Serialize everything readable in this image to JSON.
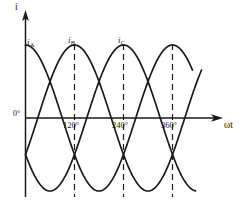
{
  "figure": {
    "axis_y_label": "i",
    "axis_x_label": "ωt",
    "origin_label": "0°",
    "line_color": "#1a1a1a",
    "background_color": "#ffffff"
  },
  "curves": [
    {
      "name": "i",
      "sub": "A",
      "label_x": 27,
      "label_y": 38,
      "phase_deg": 0
    },
    {
      "name": "i",
      "sub": "B",
      "label_x": 68,
      "label_y": 36,
      "phase_deg": 120
    },
    {
      "name": "i",
      "sub": "C",
      "label_x": 118,
      "label_y": 36,
      "phase_deg": 240
    }
  ],
  "ticks": [
    {
      "label": "120°",
      "value": 120,
      "x": 76
    },
    {
      "label": "240°",
      "value": 240,
      "x": 125
    },
    {
      "label": "360°",
      "value": 360,
      "x": 174
    }
  ],
  "chart_data": {
    "type": "line",
    "xlabel": "ωt",
    "ylabel": "i",
    "x_unit": "degrees",
    "xlim": [
      0,
      480
    ],
    "ylim": [
      -1,
      1
    ],
    "grid": false,
    "legend": "inline-curve-labels",
    "x_tick_labels": [
      "0°",
      "120°",
      "240°",
      "360°"
    ],
    "x_tick_values": [
      0,
      120,
      240,
      360
    ],
    "dashed_verticals_deg": [
      120,
      240,
      360
    ],
    "series": [
      {
        "name": "i_A",
        "label": "iA",
        "amplitude": 1,
        "phase_deg": 90,
        "formula": "i_A = Im*cos(wt)",
        "x": [
          0,
          30,
          60,
          90,
          120,
          150,
          180,
          210,
          240,
          270,
          300,
          330,
          360,
          390,
          420,
          450,
          480
        ],
        "values": [
          1.0,
          0.87,
          0.5,
          0.0,
          -0.5,
          -0.87,
          -1.0,
          -0.87,
          -0.5,
          0.0,
          0.5,
          0.87,
          1.0,
          0.87,
          0.5,
          0.0,
          -0.5
        ]
      },
      {
        "name": "i_B",
        "label": "iB",
        "amplitude": 1,
        "phase_deg": -30,
        "formula": "i_B = Im*cos(wt - 120)",
        "x": [
          0,
          30,
          60,
          90,
          120,
          150,
          180,
          210,
          240,
          270,
          300,
          330,
          360,
          390,
          420,
          450,
          480
        ],
        "values": [
          -0.5,
          0.0,
          0.5,
          0.87,
          1.0,
          0.87,
          0.5,
          0.0,
          -0.5,
          -0.87,
          -1.0,
          -0.87,
          -0.5,
          0.0,
          0.5,
          0.87,
          1.0
        ]
      },
      {
        "name": "i_C",
        "label": "iC",
        "amplitude": 1,
        "phase_deg": -150,
        "formula": "i_C = Im*cos(wt - 240)",
        "x": [
          0,
          30,
          60,
          90,
          120,
          150,
          180,
          210,
          240,
          270,
          300,
          330,
          360,
          390,
          420,
          450,
          480
        ],
        "values": [
          -0.5,
          -0.87,
          -1.0,
          -0.87,
          -0.5,
          0.0,
          0.5,
          0.87,
          1.0,
          0.87,
          0.5,
          0.0,
          -0.5,
          -0.87,
          -1.0,
          -0.87,
          -0.5
        ]
      }
    ]
  }
}
